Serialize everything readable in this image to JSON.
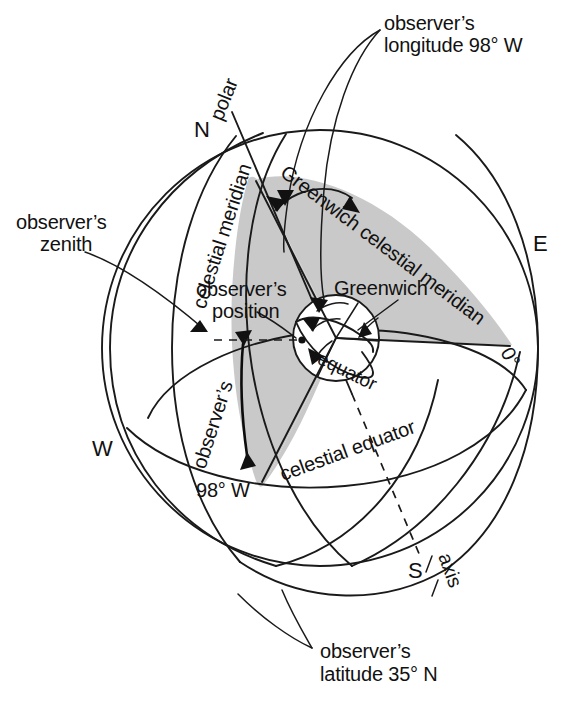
{
  "figure": {
    "type": "diagram",
    "background_color": "#ffffff",
    "ink_color": "#1a1a1a",
    "shade_color": "#c9c9c9"
  },
  "labels": {
    "observers_longitude_line1": "observer’s",
    "observers_longitude_line2": "longitude 98° W",
    "observers_zenith_line1": "observer’s",
    "observers_zenith_line2": "zenith",
    "observers_latitude_line1": "observer’s",
    "observers_latitude_line2": "latitude 35° N",
    "observers_position_line1": "observer’s",
    "observers_position_line2": "position",
    "greenwich": "Greenwich",
    "greenwich_celestial_meridian": "Greenwich celestial meridian",
    "observers_celestial_meridian_part1": "observer’s",
    "observers_celestial_meridian_part2": "celestial meridian",
    "polar": "polar",
    "axis": "axis",
    "equator": "equator",
    "celestial_equator": "celestial equator",
    "longitude_98_w": "98° W",
    "prime_meridian_zero": "0°",
    "cardinal_n": "N",
    "cardinal_e": "E",
    "cardinal_w": "W",
    "cardinal_s": "S"
  },
  "values": {
    "observer_longitude": "98° W",
    "observer_latitude": "35° N",
    "greenwich_longitude": "0°"
  }
}
